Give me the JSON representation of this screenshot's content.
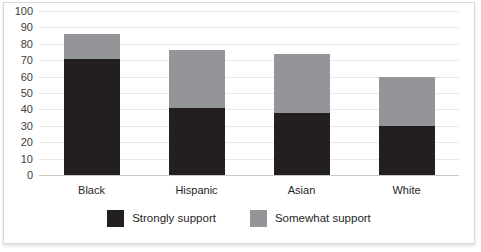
{
  "chart_data": {
    "type": "bar",
    "subtype": "stacked-bar",
    "title": "",
    "subtitle": "",
    "xlabel": "",
    "ylabel": "",
    "categories": [
      "Black",
      "Hispanic",
      "Asian",
      "White"
    ],
    "series": [
      {
        "name": "Strongly support",
        "color": "#231f20",
        "values": [
          71,
          41,
          38,
          30
        ]
      },
      {
        "name": "Somewhat support",
        "color": "#939598",
        "values": [
          15,
          35,
          36,
          30
        ]
      }
    ],
    "totals": [
      86,
      76,
      74,
      60
    ],
    "ylim": [
      0,
      100
    ],
    "yticks": [
      0,
      10,
      20,
      30,
      40,
      50,
      60,
      70,
      80,
      90,
      100
    ],
    "ytick_labels": [
      "0",
      "10",
      "20",
      "30",
      "40",
      "50",
      "60",
      "70",
      "80",
      "90",
      "100"
    ],
    "grid": true,
    "grid_axis": "y",
    "legend_position": "bottom",
    "legend": [
      "Strongly support",
      "Somewhat support"
    ]
  },
  "colors": {
    "strongly_support": "#231f20",
    "somewhat_support": "#939598",
    "gridline": "#e8e8e8",
    "baseline": "#c9c9c9",
    "card_border": "#d9d9d9",
    "background": "#ffffff"
  }
}
